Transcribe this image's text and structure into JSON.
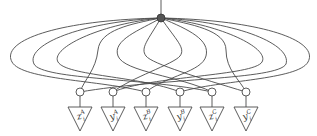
{
  "diagram": {
    "root": {
      "x": 161,
      "y": 18,
      "r": 4,
      "fill": "#555555"
    },
    "join_y": 92,
    "join_r": 4,
    "triangle": {
      "top_y": 107,
      "bottom_y": 131,
      "half_width": 12
    },
    "leaves": [
      {
        "x": 80,
        "base": "z",
        "sub": "i",
        "sup": "A"
      },
      {
        "x": 113,
        "base": "y",
        "sub": "i",
        "sup": "A"
      },
      {
        "x": 146,
        "base": "z",
        "sub": "i",
        "sup": "B"
      },
      {
        "x": 180,
        "base": "y",
        "sub": "i",
        "sup": "B"
      },
      {
        "x": 212,
        "base": "z",
        "sub": "i",
        "sup": "C"
      },
      {
        "x": 246,
        "base": "y",
        "sub": "i",
        "sup": "C"
      }
    ],
    "edges": [
      "M161,18 C60,20 0,40 12,62 C22,80 100,80 146,92",
      "M161,18 C80,22 25,45 34,64 C42,80 150,78 212,92",
      "M161,18 C100,24 50,48 58,62 C66,76 140,76 180,92",
      "M161,18 C130,24 100,30 98,50 C96,70 84,80 80,92",
      "M161,18 C140,30 112,40 118,56 C124,72 180,76 212,92",
      "M161,18 C148,40 140,48 146,56 C152,64 200,78 246,92",
      "M161,18 C176,40 186,48 180,56 C174,64 130,78 113,92",
      "M161,18 C190,30 210,40 206,56 C202,72 166,76 146,92",
      "M161,18 C190,24 226,30 226,50 C226,70 240,80 246,92",
      "M161,18 C220,24 270,48 262,62 C254,76 150,76 113,92",
      "M161,18 C240,22 292,45 286,64 C278,80 160,78 80,92",
      "M161,18 C260,20 320,40 308,62 C298,80 220,80 180,92"
    ]
  }
}
